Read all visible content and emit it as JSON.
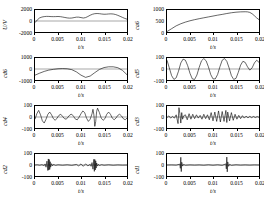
{
  "figure": {
    "xlabel": "t/s",
    "xticks": [
      "0",
      "0.005",
      "0.01",
      "0.015",
      "0.02"
    ],
    "xlim": [
      0,
      0.02
    ]
  },
  "chart_data": [
    {
      "type": "line",
      "name": "signal",
      "ylabel": "U/V",
      "xlabel": "t/s",
      "title": "",
      "xlim": [
        0,
        0.02
      ],
      "ylim": [
        -2000,
        2000
      ],
      "yticks": [
        2000,
        0,
        -2000
      ],
      "ytick_labels": [
        "2000",
        "0",
        "-2000"
      ],
      "xticks": [
        0,
        0.005,
        0.01,
        0.015,
        0.02
      ],
      "xtick_labels": [
        "0",
        "0.005",
        "0.01",
        "0.015",
        "0.02"
      ],
      "grid": false,
      "legend": "none",
      "x": [
        0,
        0.0005,
        0.001,
        0.0015,
        0.002,
        0.0025,
        0.003,
        0.0035,
        0.004,
        0.0045,
        0.005,
        0.0055,
        0.006,
        0.0065,
        0.007,
        0.0075,
        0.008,
        0.0085,
        0.009,
        0.0095,
        0.01,
        0.0105,
        0.011,
        0.0115,
        0.012,
        0.0125,
        0.013,
        0.0135,
        0.014,
        0.0145,
        0.015,
        0.0155,
        0.016,
        0.0165,
        0.017,
        0.0175,
        0.018,
        0.0185,
        0.019,
        0.0195,
        0.02
      ],
      "values": [
        -300,
        200,
        560,
        720,
        800,
        840,
        830,
        800,
        790,
        800,
        820,
        790,
        720,
        640,
        560,
        520,
        540,
        620,
        700,
        700,
        620,
        540,
        620,
        820,
        1050,
        1230,
        1330,
        1360,
        1330,
        1270,
        1230,
        1240,
        1280,
        1300,
        1270,
        1180,
        1030,
        850,
        660,
        480,
        330
      ]
    },
    {
      "type": "line",
      "name": "ca6",
      "ylabel": "ca6",
      "xlabel": "t/s",
      "title": "",
      "xlim": [
        0,
        0.02
      ],
      "ylim": [
        0,
        1000
      ],
      "yticks": [
        1000,
        500,
        0
      ],
      "ytick_labels": [
        "1000",
        "500",
        "0"
      ],
      "xticks": [
        0,
        0.005,
        0.01,
        0.015,
        0.02
      ],
      "xtick_labels": [
        "0",
        "0.005",
        "0.01",
        "0.015",
        "0.02"
      ],
      "grid": false,
      "legend": "none",
      "x": [
        0,
        0.001,
        0.002,
        0.003,
        0.004,
        0.005,
        0.006,
        0.007,
        0.008,
        0.009,
        0.01,
        0.011,
        0.012,
        0.013,
        0.014,
        0.015,
        0.016,
        0.017,
        0.0175,
        0.018,
        0.0185,
        0.019,
        0.0195,
        0.02
      ],
      "values": [
        20,
        150,
        280,
        375,
        450,
        510,
        560,
        605,
        645,
        685,
        725,
        765,
        800,
        840,
        875,
        900,
        915,
        920,
        915,
        890,
        830,
        740,
        640,
        560
      ]
    },
    {
      "type": "line",
      "name": "cd6",
      "ylabel": "cd6",
      "xlabel": "t/s",
      "title": "",
      "xlim": [
        0,
        0.02
      ],
      "ylim": [
        -1000,
        1000
      ],
      "yticks": [
        1000,
        0,
        -1000
      ],
      "ytick_labels": [
        "1000",
        "0",
        "-1000"
      ],
      "xticks": [
        0,
        0.005,
        0.01,
        0.015,
        0.02
      ],
      "xtick_labels": [
        "0",
        "0.005",
        "0.01",
        "0.015",
        "0.02"
      ],
      "grid": false,
      "legend": "none",
      "x": [
        0,
        0.001,
        0.002,
        0.003,
        0.004,
        0.005,
        0.006,
        0.007,
        0.008,
        0.009,
        0.01,
        0.011,
        0.012,
        0.013,
        0.014,
        0.015,
        0.016,
        0.017,
        0.018,
        0.019,
        0.02
      ],
      "values": [
        -560,
        -380,
        -220,
        -100,
        -30,
        20,
        40,
        20,
        -60,
        -260,
        -560,
        -760,
        -640,
        -330,
        -40,
        130,
        200,
        200,
        120,
        -120,
        -520
      ]
    },
    {
      "type": "line",
      "name": "cd5",
      "ylabel": "cd5",
      "xlabel": "t/s",
      "title": "",
      "xlim": [
        0,
        0.02
      ],
      "ylim": [
        -100,
        100
      ],
      "yticks": [
        100,
        0,
        -100
      ],
      "ytick_labels": [
        "100",
        "0",
        "-100"
      ],
      "xticks": [
        0,
        0.005,
        0.01,
        0.015,
        0.02
      ],
      "xtick_labels": [
        "0",
        "0.005",
        "0.01",
        "0.015",
        "0.02"
      ],
      "grid": false,
      "legend": "none",
      "x": [
        0,
        0.0005,
        0.001,
        0.0015,
        0.002,
        0.0025,
        0.003,
        0.0035,
        0.004,
        0.0045,
        0.005,
        0.0055,
        0.006,
        0.0065,
        0.007,
        0.0075,
        0.008,
        0.0085,
        0.009,
        0.0095,
        0.01,
        0.0105,
        0.011,
        0.0115,
        0.012,
        0.0125,
        0.013,
        0.0135,
        0.014,
        0.0145,
        0.015,
        0.0155,
        0.016,
        0.0165,
        0.017,
        0.0175,
        0.018,
        0.0185,
        0.019,
        0.0195,
        0.02
      ],
      "values": [
        80,
        10,
        -60,
        -95,
        -80,
        -20,
        55,
        90,
        80,
        30,
        -40,
        -90,
        -95,
        -55,
        15,
        75,
        95,
        75,
        20,
        -50,
        -90,
        -90,
        -50,
        20,
        80,
        95,
        70,
        10,
        -60,
        -95,
        -85,
        -30,
        35,
        70,
        60,
        20,
        -10,
        10,
        55,
        80,
        60
      ]
    },
    {
      "type": "line",
      "name": "cd4",
      "ylabel": "cd4",
      "xlabel": "t/s",
      "title": "",
      "xlim": [
        0,
        0.02
      ],
      "ylim": [
        -100,
        100
      ],
      "yticks": [
        100,
        0,
        -100
      ],
      "ytick_labels": [
        "100",
        "0",
        "-100"
      ],
      "xticks": [
        0,
        0.005,
        0.01,
        0.015,
        0.02
      ],
      "xtick_labels": [
        "0",
        "0.005",
        "0.01",
        "0.015",
        "0.02"
      ],
      "grid": false,
      "legend": "none",
      "x": [
        0,
        0.0004,
        0.0008,
        0.0012,
        0.0016,
        0.002,
        0.0024,
        0.0028,
        0.0032,
        0.0036,
        0.004,
        0.0044,
        0.0048,
        0.0052,
        0.0056,
        0.006,
        0.0064,
        0.0068,
        0.0072,
        0.0076,
        0.008,
        0.0084,
        0.0088,
        0.0092,
        0.0096,
        0.01,
        0.0104,
        0.0108,
        0.0112,
        0.0116,
        0.012,
        0.0124,
        0.0126,
        0.0128,
        0.013,
        0.0132,
        0.0134,
        0.0136,
        0.014,
        0.0144,
        0.0148,
        0.0152,
        0.0156,
        0.016,
        0.0164,
        0.0168,
        0.0172,
        0.0176,
        0.018,
        0.0184,
        0.0188,
        0.0192,
        0.0196,
        0.02
      ],
      "values": [
        -20,
        30,
        60,
        20,
        -35,
        -55,
        -20,
        25,
        45,
        20,
        -15,
        -30,
        -10,
        15,
        25,
        5,
        -15,
        -20,
        0,
        20,
        25,
        5,
        -20,
        -25,
        0,
        30,
        55,
        40,
        -10,
        -40,
        -20,
        30,
        70,
        20,
        -85,
        -40,
        50,
        80,
        40,
        -10,
        -30,
        -15,
        25,
        45,
        25,
        -10,
        -25,
        -10,
        15,
        25,
        10,
        -15,
        -25,
        -10
      ]
    },
    {
      "type": "line",
      "name": "cd3",
      "ylabel": "cd3",
      "xlabel": "t/s",
      "title": "",
      "xlim": [
        0,
        0.02
      ],
      "ylim": [
        -100,
        100
      ],
      "yticks": [
        100,
        0,
        -100
      ],
      "ytick_labels": [
        "100",
        "0",
        "-100"
      ],
      "xticks": [
        0,
        0.005,
        0.01,
        0.015,
        0.02
      ],
      "xtick_labels": [
        "0",
        "0.005",
        "0.01",
        "0.015",
        "0.02"
      ],
      "grid": false,
      "legend": "none",
      "x": [
        0,
        0.0004,
        0.0008,
        0.0012,
        0.0016,
        0.002,
        0.0024,
        0.0026,
        0.0028,
        0.003,
        0.0032,
        0.0034,
        0.0036,
        0.004,
        0.0044,
        0.0048,
        0.0052,
        0.0056,
        0.006,
        0.0064,
        0.0068,
        0.0072,
        0.0076,
        0.008,
        0.0084,
        0.0088,
        0.0092,
        0.0096,
        0.01,
        0.0104,
        0.0108,
        0.0112,
        0.0116,
        0.012,
        0.0124,
        0.0128,
        0.013,
        0.0132,
        0.0136,
        0.014,
        0.0144,
        0.0148,
        0.0152,
        0.0156,
        0.016,
        0.0164,
        0.0168,
        0.0172,
        0.0176,
        0.018,
        0.0184,
        0.0188,
        0.0192,
        0.0196,
        0.02
      ],
      "values": [
        -5,
        10,
        -10,
        5,
        -10,
        20,
        -60,
        85,
        30,
        -55,
        40,
        -20,
        10,
        20,
        -25,
        30,
        -20,
        25,
        -15,
        20,
        -10,
        15,
        -20,
        25,
        -15,
        20,
        -25,
        40,
        -35,
        45,
        -40,
        55,
        -45,
        50,
        -40,
        60,
        -50,
        45,
        -35,
        40,
        -30,
        25,
        -20,
        15,
        -15,
        12,
        -10,
        8,
        -8,
        6,
        -6,
        5,
        -5,
        4,
        -3
      ]
    },
    {
      "type": "line",
      "name": "cd2",
      "ylabel": "cd2",
      "xlabel": "t/s",
      "title": "",
      "xlim": [
        0,
        0.02
      ],
      "ylim": [
        -100,
        100
      ],
      "yticks": [
        100,
        0,
        -100
      ],
      "ytick_labels": [
        "100",
        "0",
        "-100"
      ],
      "grid": false,
      "legend": "none",
      "burst_centers": [
        0.003,
        0.013
      ],
      "burst_amplitude": 55,
      "baseline_noise": 6,
      "x": [
        0,
        0.0005,
        0.001,
        0.0015,
        0.002,
        0.0022,
        0.0024,
        0.0026,
        0.0028,
        0.0029,
        0.003,
        0.0031,
        0.0032,
        0.0033,
        0.0034,
        0.0036,
        0.0038,
        0.004,
        0.0045,
        0.005,
        0.006,
        0.007,
        0.008,
        0.009,
        0.0095,
        0.01,
        0.0105,
        0.011,
        0.0115,
        0.012,
        0.0122,
        0.0124,
        0.0126,
        0.0128,
        0.0129,
        0.013,
        0.0131,
        0.0132,
        0.0133,
        0.0134,
        0.0136,
        0.0138,
        0.014,
        0.0145,
        0.015,
        0.016,
        0.017,
        0.018,
        0.019,
        0.02
      ],
      "values": [
        0,
        2,
        -2,
        3,
        -5,
        10,
        -20,
        35,
        -50,
        55,
        -45,
        50,
        -40,
        30,
        -20,
        12,
        -8,
        5,
        -3,
        2,
        -2,
        2,
        -3,
        5,
        -8,
        10,
        -12,
        10,
        -8,
        6,
        -12,
        22,
        -38,
        52,
        -58,
        50,
        -45,
        38,
        -28,
        18,
        -10,
        6,
        -4,
        3,
        -2,
        2,
        -2,
        1,
        -1,
        0
      ]
    },
    {
      "type": "line",
      "name": "cd1",
      "ylabel": "cd1",
      "xlabel": "t/s",
      "title": "",
      "xlim": [
        0,
        0.02
      ],
      "ylim": [
        -100,
        100
      ],
      "yticks": [
        100,
        0,
        -100
      ],
      "ytick_labels": [
        "100",
        "0",
        "-100"
      ],
      "grid": false,
      "legend": "none",
      "impulse_times": [
        0.003,
        0.013
      ],
      "impulse_amplitude": 75,
      "baseline_noise": 2,
      "x": [
        0,
        0.001,
        0.002,
        0.0028,
        0.0029,
        0.003,
        0.0031,
        0.0032,
        0.0034,
        0.0036,
        0.004,
        0.005,
        0.006,
        0.007,
        0.008,
        0.009,
        0.01,
        0.011,
        0.012,
        0.0128,
        0.0129,
        0.013,
        0.0131,
        0.0132,
        0.0134,
        0.0136,
        0.014,
        0.015,
        0.016,
        0.017,
        0.018,
        0.019,
        0.02
      ],
      "values": [
        0,
        1,
        -1,
        8,
        -30,
        70,
        -60,
        25,
        -10,
        5,
        -2,
        1,
        -1,
        1,
        -2,
        2,
        -2,
        2,
        -3,
        10,
        -35,
        72,
        -62,
        28,
        -12,
        6,
        -3,
        2,
        -1,
        1,
        -1,
        1,
        0
      ]
    }
  ]
}
